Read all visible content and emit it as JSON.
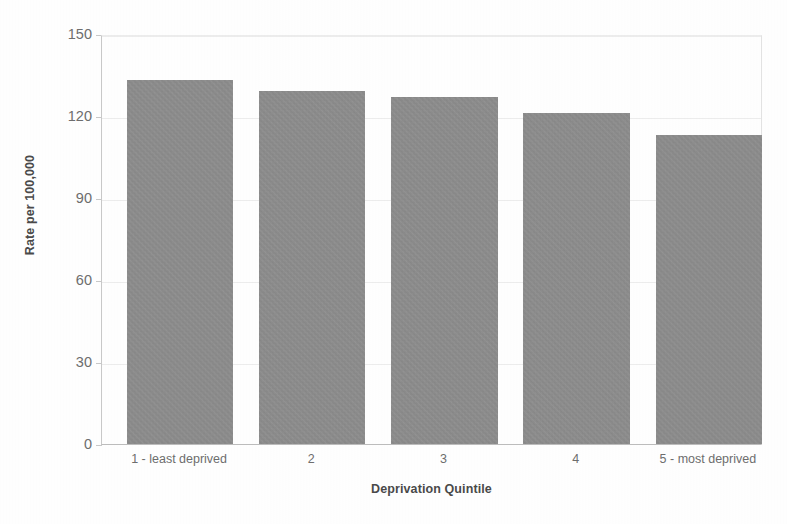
{
  "chart_data": {
    "type": "bar",
    "title": "",
    "subtitle": "",
    "xlabel": "Deprivation Quintile",
    "ylabel": "Rate per 100,000",
    "categories": [
      "1 - least deprived",
      "2",
      "3",
      "4",
      "5 - most deprived"
    ],
    "values": [
      133,
      129,
      127,
      121,
      113
    ],
    "series": [
      {
        "name": "Rate per 100,000",
        "values": [
          133,
          129,
          127,
          121,
          113
        ]
      }
    ],
    "ylim": [
      0,
      150
    ],
    "yticks": [
      0,
      30,
      60,
      90,
      120,
      150
    ],
    "ytick_labels": [
      "0",
      "30",
      "60",
      "90",
      "120",
      "150"
    ],
    "grid": true,
    "grid_axis": "y",
    "legend": false,
    "legend_position": "none",
    "bar_color": "#8b8b8b",
    "background_color": "#ffffff",
    "gridline_color": "#ededed",
    "axis_color": "#c9c9c9",
    "text_color": "#6e6e6e"
  },
  "axes": {
    "y_title": "Rate per 100,000",
    "x_title": "Deprivation Quintile",
    "y_tick_labels": [
      "150",
      "120",
      "90",
      "60",
      "30",
      "0"
    ],
    "x_tick_labels": [
      "1 - least deprived",
      "2",
      "3",
      "4",
      "5 - most deprived"
    ]
  }
}
